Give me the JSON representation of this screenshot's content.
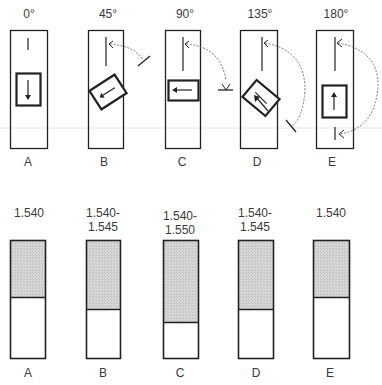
{
  "top_row": {
    "angles": [
      "0°",
      "45°",
      "90°",
      "135°",
      "180°"
    ],
    "letters": [
      "A",
      "B",
      "C",
      "D",
      "E"
    ]
  },
  "bottom_row": {
    "values": [
      [
        "1.540",
        ""
      ],
      [
        "1.540-",
        "1.545"
      ],
      [
        "1.540-",
        "1.550"
      ],
      [
        "1.540-",
        "1.545"
      ],
      [
        "1.540",
        ""
      ]
    ],
    "letters": [
      "A",
      "B",
      "C",
      "D",
      "E"
    ]
  },
  "colors": {
    "stroke": "#222222",
    "fill_shaded": "#cfcfcf",
    "arc": "#777777"
  }
}
